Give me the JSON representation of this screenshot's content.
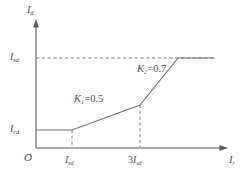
{
  "figure": {
    "type": "line-characteristic",
    "background": "#ffffff",
    "line_color": "#6b7074",
    "axis_color": "#555a5e",
    "dash_color": "#7b8084"
  },
  "axes": {
    "y_axis_label": {
      "base": "I",
      "sub": "d"
    },
    "x_axis_label": {
      "base": "I",
      "sub": "r"
    },
    "origin_label": "O",
    "y_ticks": [
      {
        "base": "I",
        "sub": "sd",
        "pixel_y": 58
      },
      {
        "base": "I",
        "sub": "cd",
        "pixel_y": 130
      }
    ],
    "x_ticks": [
      {
        "prefix": "",
        "base": "I",
        "sub": "sd",
        "pixel_x": 72
      },
      {
        "prefix": "3",
        "base": "I",
        "sub": "sd",
        "pixel_x": 140
      }
    ]
  },
  "annotations": [
    {
      "name": "slope-1",
      "base": "K",
      "sub": "1",
      "value": "=0.5"
    },
    {
      "name": "slope-2",
      "base": "K",
      "sub": "2",
      "value": "=0.7"
    }
  ],
  "chart_data": {
    "type": "line",
    "title": "",
    "xlabel": "I_r",
    "ylabel": "I_d",
    "grid": false,
    "legend": null,
    "x_ticklabels": [
      "O",
      "I_sd",
      "3I_sd"
    ],
    "y_ticklabels": [
      "I_cd",
      "I_sd"
    ],
    "series": [
      {
        "name": "differential protection characteristic",
        "style": "solid",
        "points_pixel": [
          [
            36,
            130
          ],
          [
            72,
            130
          ],
          [
            140,
            105
          ],
          [
            178,
            58
          ],
          [
            215,
            58
          ]
        ],
        "segments": [
          {
            "name": "minimum pickup plateau",
            "slope": 0,
            "from": "0",
            "to": "I_sd",
            "level": "I_cd"
          },
          {
            "name": "first restraint slope",
            "slope": 0.5,
            "label": "K_1=0.5",
            "from": "I_sd",
            "to": "3I_sd"
          },
          {
            "name": "second restraint slope",
            "slope": 0.7,
            "label": "K_2=0.7",
            "from": "3I_sd",
            "to": "saturation"
          },
          {
            "name": "upper saturation plateau",
            "slope": 0,
            "level": "I_sd"
          }
        ]
      }
    ],
    "guides": [
      {
        "name": "horizontal-guide-Isd",
        "orientation": "horizontal",
        "at": "I_sd",
        "style": "dashed"
      },
      {
        "name": "vertical-guide-Isd",
        "orientation": "vertical",
        "at": "I_sd",
        "style": "dashed"
      },
      {
        "name": "vertical-guide-3Isd",
        "orientation": "vertical",
        "at": "3I_sd",
        "style": "dashed"
      }
    ]
  }
}
